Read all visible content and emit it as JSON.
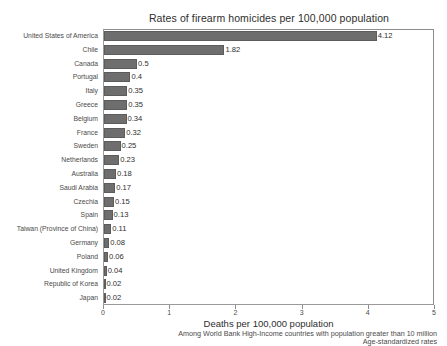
{
  "chart_data": {
    "type": "bar",
    "orientation": "horizontal",
    "title": "Rates of firearm homicides per 100,000 population",
    "xlabel": "Deaths per 100,000 population",
    "ylabel": "",
    "xlim": [
      0,
      5
    ],
    "xticks": [
      "0",
      "1",
      "2",
      "3",
      "4",
      "5"
    ],
    "grid": false,
    "legend": null,
    "bar_color": "#6e6e6e",
    "categories": [
      "United States of America",
      "Chile",
      "Canada",
      "Portugal",
      "Italy",
      "Greece",
      "Belgium",
      "France",
      "Sweden",
      "Netherlands",
      "Australia",
      "Saudi Arabia",
      "Czechia",
      "Spain",
      "Taiwan (Province of China)",
      "Germany",
      "Poland",
      "United Kingdom",
      "Republic of Korea",
      "Japan"
    ],
    "values": [
      4.12,
      1.82,
      0.5,
      0.4,
      0.35,
      0.35,
      0.34,
      0.32,
      0.25,
      0.23,
      0.18,
      0.17,
      0.15,
      0.13,
      0.11,
      0.08,
      0.06,
      0.04,
      0.02,
      0.02
    ],
    "value_labels": [
      "4.12",
      "1.82",
      "0.5",
      "0.4",
      "0.35",
      "0.35",
      "0.34",
      "0.32",
      "0.25",
      "0.23",
      "0.18",
      "0.17",
      "0.15",
      "0.13",
      "0.11",
      "0.08",
      "0.06",
      "0.04",
      "0.02",
      "0.02"
    ],
    "annotations": [
      "Among World Bank High-Income countries with population greater than 10 million",
      "Age-standardized rates"
    ]
  },
  "footnotes": {
    "line1": "Among World Bank High-Income countries with population greater than 10 million",
    "line2": "Age-standardized rates"
  },
  "watermark": ""
}
